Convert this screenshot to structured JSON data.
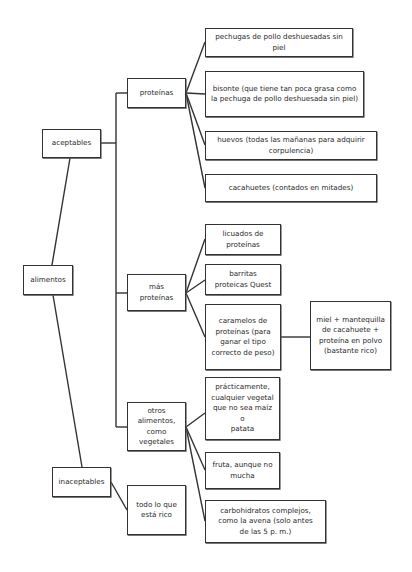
{
  "diagram": {
    "type": "tree",
    "root": {
      "id": "alimentos",
      "label": "alimentos"
    },
    "nodes": {
      "aceptables": {
        "label": "aceptables"
      },
      "inaceptables": {
        "label": "inaceptables"
      },
      "proteinas": {
        "label": "proteínas"
      },
      "mas_proteinas": {
        "label": "más proteínas"
      },
      "otros": {
        "label": "otros alimentos, como vegetales"
      },
      "todo_rico": {
        "label": "todo lo que está rico"
      },
      "pechugas": {
        "label": "pechugas de pollo deshuesadas sin piel"
      },
      "bisonte": {
        "label": "bisonte (que tiene tan poca grasa como la pechuga de pollo deshuesada sin piel)"
      },
      "huevos": {
        "label": "huevos (todas las mañanas para adquirir corpulencia)"
      },
      "cacahuetes": {
        "label": "cacahuetes (contados en mitades)"
      },
      "licuados": {
        "label": "licuados de proteínas"
      },
      "barritas": {
        "label": "barritas proteicas Quest"
      },
      "caramelos": {
        "label": "caramelos de proteínas (para ganar el tipo correcto de peso)"
      },
      "miel": {
        "label": "miel + mantequilla de cacahuete + proteína en polvo (bastante rico)"
      },
      "practicamente": {
        "label": "prácticamente, cualquier vegetal que no sea maíz o patata"
      },
      "fruta": {
        "label": "fruta, aunque no mucha"
      },
      "carbohidratos": {
        "label": "carbohidratos complejos, como la avena (solo antes de las 5 p. m.)"
      }
    },
    "edges": [
      [
        "alimentos",
        "aceptables"
      ],
      [
        "alimentos",
        "inaceptables"
      ],
      [
        "aceptables",
        "proteinas"
      ],
      [
        "aceptables",
        "mas_proteinas"
      ],
      [
        "aceptables",
        "otros"
      ],
      [
        "inaceptables",
        "todo_rico"
      ],
      [
        "proteinas",
        "pechugas"
      ],
      [
        "proteinas",
        "bisonte"
      ],
      [
        "proteinas",
        "huevos"
      ],
      [
        "proteinas",
        "cacahuetes"
      ],
      [
        "mas_proteinas",
        "licuados"
      ],
      [
        "mas_proteinas",
        "barritas"
      ],
      [
        "mas_proteinas",
        "caramelos"
      ],
      [
        "caramelos",
        "miel"
      ],
      [
        "otros",
        "practicamente"
      ],
      [
        "otros",
        "fruta"
      ],
      [
        "otros",
        "carbohidratos"
      ]
    ]
  },
  "lines": {
    "l1": "más",
    "l2": "proteínas",
    "otros_1": "otros",
    "otros_2": "alimentos,",
    "otros_3": "como vegetales",
    "todo_1": "todo lo que",
    "todo_2": "está rico",
    "bisonte_1": "bisonte (que tiene tan poca grasa como",
    "bisonte_2": "la pechuga de pollo deshuesada sin piel)",
    "huevos_1": "huevos (todas las mañanas para adquirir",
    "huevos_2": "corpulencia)",
    "licuados_1": "licuados de",
    "licuados_2": "proteínas",
    "barritas_1": "barritas",
    "barritas_2": "proteicas Quest",
    "caramelos_1": "caramelos de",
    "caramelos_2": "proteínas (para",
    "caramelos_3": "ganar el tipo",
    "caramelos_4": "correcto de peso)",
    "miel_1": "miel + mantequilla",
    "miel_2": "de cacahuete +",
    "miel_3": "proteína en polvo",
    "miel_4": "(bastante rico)",
    "prac_1": "prácticamente,",
    "prac_2": "cualquier vegetal",
    "prac_3": "que no sea maíz o",
    "prac_4": "patata",
    "fruta_1": "fruta, aunque no",
    "fruta_2": "mucha",
    "carb_1": "carbohidratos complejos,",
    "carb_2": "como la avena (solo antes",
    "carb_3": "de las 5 p. m.)"
  }
}
